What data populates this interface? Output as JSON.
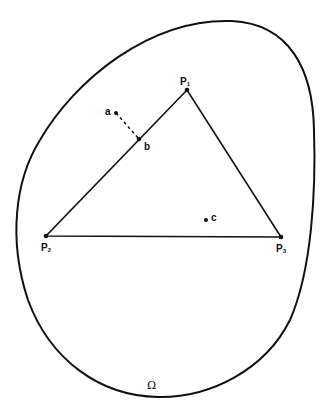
{
  "diagram": {
    "region_label": "Ω",
    "vertices": [
      {
        "name": "P",
        "sub": "1",
        "x": 187,
        "y": 90
      },
      {
        "name": "P",
        "sub": "2",
        "x": 46,
        "y": 236
      },
      {
        "name": "P",
        "sub": "3",
        "x": 281,
        "y": 237
      }
    ],
    "points": [
      {
        "name": "a",
        "x": 116,
        "y": 113
      },
      {
        "name": "b",
        "x": 139,
        "y": 139
      },
      {
        "name": "c",
        "x": 206,
        "y": 220
      }
    ],
    "colors": {
      "stroke": "#111111",
      "background": "#ffffff"
    }
  }
}
